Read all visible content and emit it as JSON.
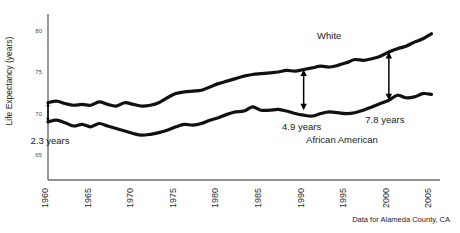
{
  "chart_data": {
    "type": "line",
    "title": "",
    "xlabel": "",
    "ylabel": "Life Expectancy (years)",
    "ylim": [
      62,
      81.5
    ],
    "xlim": [
      1960,
      2006
    ],
    "grid": false,
    "legend_position": "inline-labels",
    "yticks": [
      65,
      70,
      75,
      80
    ],
    "ytick_labels": [
      "65",
      "70",
      "75",
      "80"
    ],
    "xticks": [
      1960,
      1965,
      1970,
      1975,
      1980,
      1985,
      1990,
      1995,
      2000,
      2005
    ],
    "xtick_labels": [
      "1960",
      "1965",
      "1970",
      "1975",
      "1980",
      "1985",
      "1990",
      "1995",
      "2000",
      "2005"
    ],
    "x": [
      1960,
      1961,
      1962,
      1963,
      1964,
      1965,
      1966,
      1967,
      1968,
      1969,
      1970,
      1971,
      1972,
      1973,
      1974,
      1975,
      1976,
      1977,
      1978,
      1979,
      1980,
      1981,
      1982,
      1983,
      1984,
      1985,
      1986,
      1987,
      1988,
      1989,
      1990,
      1991,
      1992,
      1993,
      1994,
      1995,
      1996,
      1997,
      1998,
      1999,
      2000,
      2001,
      2002,
      2003,
      2004,
      2005
    ],
    "series": [
      {
        "name": "White",
        "color": "#111111",
        "values": [
          71.3,
          71.5,
          71.2,
          71.0,
          71.1,
          71.0,
          71.4,
          71.1,
          70.9,
          71.3,
          71.1,
          70.9,
          71.0,
          71.3,
          71.9,
          72.4,
          72.6,
          72.7,
          72.8,
          73.2,
          73.6,
          73.9,
          74.2,
          74.5,
          74.7,
          74.8,
          74.9,
          75.0,
          75.2,
          75.1,
          75.3,
          75.5,
          75.7,
          75.6,
          75.8,
          76.1,
          76.5,
          76.4,
          76.6,
          76.9,
          77.4,
          77.8,
          78.1,
          78.6,
          79.0,
          79.6
        ]
      },
      {
        "name": "African American",
        "color": "#111111",
        "values": [
          69.0,
          69.2,
          68.9,
          68.5,
          68.7,
          68.4,
          68.8,
          68.5,
          68.2,
          67.9,
          67.6,
          67.4,
          67.5,
          67.7,
          68.0,
          68.4,
          68.7,
          68.6,
          68.8,
          69.2,
          69.5,
          69.9,
          70.2,
          70.3,
          70.8,
          70.4,
          70.4,
          70.5,
          70.3,
          70.0,
          69.8,
          69.7,
          70.0,
          70.2,
          70.1,
          70.0,
          70.1,
          70.4,
          70.8,
          71.2,
          71.6,
          72.2,
          71.9,
          72.0,
          72.4,
          72.3
        ]
      }
    ],
    "annotations": [
      {
        "name": "gap-1960",
        "label": "2.3 years",
        "year": 1960,
        "value": 2.3,
        "y_top": 71.3,
        "y_bottom": 69.0
      },
      {
        "name": "gap-1990",
        "label": "4.9 years",
        "year": 1990,
        "value": 4.9,
        "y_top": 75.3,
        "y_bottom": 70.4
      },
      {
        "name": "gap-2000",
        "label": "7.8 years",
        "year": 2000,
        "value": 7.8,
        "y_top": 77.4,
        "y_bottom": 71.6
      }
    ],
    "series_labels": [
      {
        "name": "white-series-label",
        "text": "White",
        "year": 1993,
        "value": 79.0
      },
      {
        "name": "african-american-series-label",
        "text": "African American",
        "year": 1994.5,
        "value": 66.5
      }
    ],
    "source_note": "Data for Alameda County, CA"
  }
}
